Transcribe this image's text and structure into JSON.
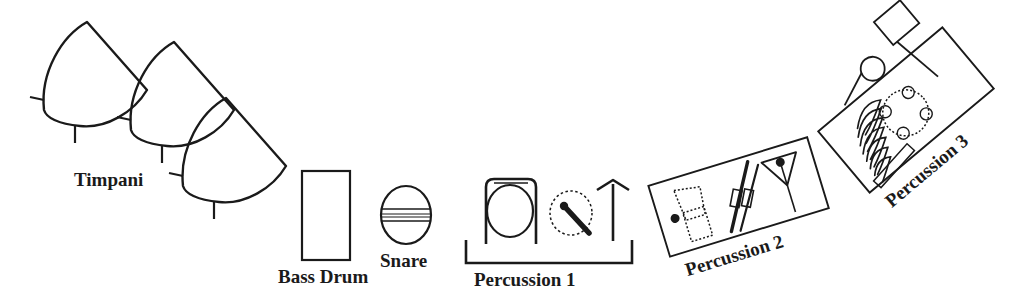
{
  "diagram": {
    "background_color": "#ffffff",
    "stroke_color": "#1a1a1a",
    "label_color": "#1a1a1a"
  },
  "labels": {
    "timpani": "Timpani",
    "bass_drum": "Bass Drum",
    "snare": "Snare",
    "percussion_1": "Percussion 1",
    "percussion_2": "Percussion 2",
    "percussion_3": "Percussion 3"
  },
  "groups": [
    {
      "id": "timpani",
      "label": "Timpani",
      "label_rotation": 0,
      "count": 3,
      "items": [
        "timpani-drum-1",
        "timpani-drum-2",
        "timpani-drum-3"
      ]
    },
    {
      "id": "bass-drum",
      "label": "Bass Drum",
      "label_rotation": 0,
      "count": 1,
      "items": [
        "bass-drum-rectangle"
      ]
    },
    {
      "id": "snare",
      "label": "Snare",
      "label_rotation": 0,
      "count": 1,
      "items": [
        "snare-drum-circle"
      ]
    },
    {
      "id": "percussion-1",
      "label": "Percussion 1",
      "label_rotation": 0,
      "count": 3,
      "items": [
        "gong-in-frame",
        "suspended-cymbal-with-mallet",
        "cymbal-stand"
      ]
    },
    {
      "id": "percussion-2",
      "label": "Percussion 2",
      "label_rotation": -17,
      "count": 3,
      "items": [
        "cowbell-on-table",
        "claves-sticks",
        "suspended-triangle"
      ]
    },
    {
      "id": "percussion-3",
      "label": "Percussion 3",
      "label_rotation": -40,
      "count": 4,
      "items": [
        "coil-spring",
        "tambourine",
        "small-cymbal-with-beater",
        "woodblock"
      ]
    }
  ]
}
